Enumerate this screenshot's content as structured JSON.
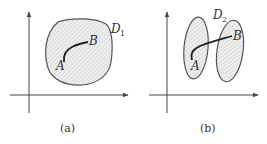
{
  "figure": {
    "panels": [
      {
        "id": "a",
        "caption": "(a)",
        "region_label": "D",
        "region_subscript": "1",
        "point_start": "A",
        "point_end": "B",
        "description": "simply connected region containing curve from A to B"
      },
      {
        "id": "b",
        "caption": "(b)",
        "region_label": "D",
        "region_subscript": "2",
        "point_start": "A",
        "point_end": "B",
        "description": "disconnected region of two parts; curve from A to B crosses outside"
      }
    ],
    "colors": {
      "stroke": "#444444",
      "hatch": "#bbbbbb",
      "fill": "#eeeeee"
    }
  }
}
